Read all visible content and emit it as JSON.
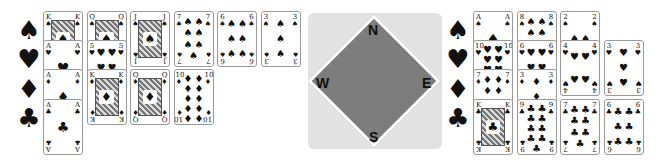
{
  "suits": {
    "spades": "♠",
    "hearts": "♥",
    "diamonds": "♦",
    "clubs": "♣"
  },
  "left_hand": {
    "suit_labels": [
      "♠",
      "♥",
      "♦",
      "♣"
    ],
    "rows": [
      {
        "suit": "spades",
        "cards": [
          "K",
          "Q",
          "J",
          "7",
          "6",
          "3"
        ]
      },
      {
        "suit": "hearts",
        "cards": [
          "A",
          "5"
        ]
      },
      {
        "suit": "diamonds",
        "cards": [
          "A",
          "K",
          "Q",
          "10"
        ]
      },
      {
        "suit": "clubs",
        "cards": [
          "A"
        ]
      }
    ]
  },
  "right_hand": {
    "suit_labels": [
      "♠",
      "♥",
      "♦",
      "♣"
    ],
    "rows": [
      {
        "suit": "spades",
        "cards": [
          "A",
          "8",
          "2"
        ]
      },
      {
        "suit": "hearts",
        "cards": [
          "10",
          "6",
          "4",
          "3"
        ]
      },
      {
        "suit": "diamonds",
        "cards": [
          "7",
          "3"
        ]
      },
      {
        "suit": "clubs",
        "cards": [
          "K",
          "9",
          "7",
          "6"
        ]
      }
    ]
  },
  "compass": {
    "north": "N",
    "south": "S",
    "east": "E",
    "west": "W",
    "colors": {
      "background": "#e2e2e2",
      "diamond": "#7d7d7d",
      "border": "#ffffff"
    }
  }
}
